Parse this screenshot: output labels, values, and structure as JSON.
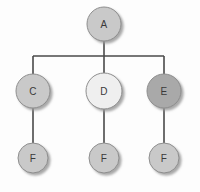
{
  "diagram": {
    "background_color": "#fdfdfd",
    "edge_color": "#4a4a4a",
    "node_border_color": "#8e8e8e",
    "label_color": "#3a3a3a",
    "nodes": [
      {
        "id": "A",
        "label": "A",
        "cx": 104,
        "cy": 24,
        "r": 17,
        "fill": "#c9c9c9",
        "level": 0
      },
      {
        "id": "C",
        "label": "C",
        "cx": 33,
        "cy": 91,
        "r": 17,
        "fill": "#c9c9c9",
        "level": 1
      },
      {
        "id": "D",
        "label": "D",
        "cx": 104,
        "cy": 91,
        "r": 18,
        "fill": "#efefef",
        "level": 1
      },
      {
        "id": "E",
        "label": "E",
        "cx": 164,
        "cy": 91,
        "r": 17,
        "fill": "#a9a9a9",
        "level": 1
      },
      {
        "id": "F1",
        "label": "F",
        "cx": 33,
        "cy": 158,
        "r": 15,
        "fill": "#c9c9c9",
        "level": 2
      },
      {
        "id": "F2",
        "label": "F",
        "cx": 104,
        "cy": 158,
        "r": 15,
        "fill": "#c9c9c9",
        "level": 2
      },
      {
        "id": "F3",
        "label": "F",
        "cx": 164,
        "cy": 158,
        "r": 15,
        "fill": "#c9c9c9",
        "level": 2
      }
    ],
    "edges": [
      {
        "id": "a-bus",
        "from": "A",
        "to": "bus",
        "points": "104,41 104,56"
      },
      {
        "id": "bus",
        "from": "bus",
        "to": "bus",
        "points": "33,56 164,56"
      },
      {
        "id": "bus-c",
        "from": "bus",
        "to": "C",
        "points": "33,56 33,74"
      },
      {
        "id": "bus-d",
        "from": "bus",
        "to": "D",
        "points": "104,56 104,73"
      },
      {
        "id": "bus-e",
        "from": "bus",
        "to": "E",
        "points": "164,56 164,74"
      },
      {
        "id": "c-f1",
        "from": "C",
        "to": "F1",
        "points": "33,108 33,143"
      },
      {
        "id": "d-f2",
        "from": "D",
        "to": "F2",
        "points": "104,109 104,143"
      },
      {
        "id": "e-f3",
        "from": "E",
        "to": "F3",
        "points": "164,108 164,143"
      }
    ]
  }
}
